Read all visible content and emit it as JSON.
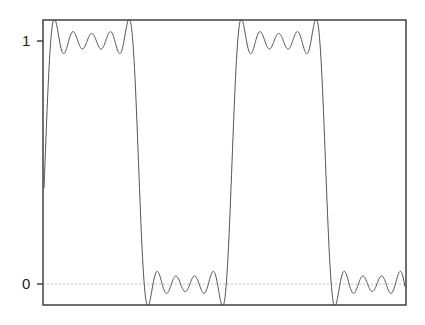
{
  "chart_data": {
    "type": "line",
    "title": "",
    "xlabel": "",
    "ylabel": "",
    "yticks": [
      {
        "value": 0,
        "label": "0"
      },
      {
        "value": 1,
        "label": "1"
      }
    ],
    "ylim": [
      -0.09,
      1.09
    ],
    "reference_line": {
      "y": 0,
      "style": "dotted"
    },
    "grid": false,
    "legend": null,
    "series": [
      {
        "name": "square-wave-approximation",
        "harmonics": 9,
        "period_px": 187,
        "phase_px": 45,
        "amplitude": 0.5,
        "offset": 0.5,
        "color": "#555555"
      }
    ]
  },
  "colors": {
    "axis": "#333333",
    "line": "#555555",
    "reference": "#aaaaaa"
  }
}
